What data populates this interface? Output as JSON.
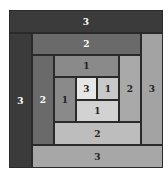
{
  "diagram": {
    "blocks": [
      {
        "id": "outer-top-3",
        "label": "3",
        "x": 9,
        "y": 10,
        "w": 154,
        "h": 23,
        "color": "#3b3b3b",
        "text": "#ffffff"
      },
      {
        "id": "outer-left-3",
        "label": "3",
        "x": 9,
        "y": 33,
        "w": 23,
        "h": 135,
        "color": "#3b3b3b",
        "text": "#ffffff"
      },
      {
        "id": "top-2",
        "label": "2",
        "x": 32,
        "y": 33,
        "w": 109,
        "h": 22,
        "color": "#6a6a6a",
        "text": "#ffffff"
      },
      {
        "id": "right-3",
        "label": "3",
        "x": 141,
        "y": 33,
        "w": 22,
        "h": 112,
        "color": "#a3a3a3",
        "text": "#222222"
      },
      {
        "id": "left-2",
        "label": "2",
        "x": 32,
        "y": 55,
        "w": 22,
        "h": 90,
        "color": "#6a6a6a",
        "text": "#ffffff"
      },
      {
        "id": "top-1",
        "label": "1",
        "x": 54,
        "y": 55,
        "w": 65,
        "h": 22,
        "color": "#8a8a8a",
        "text": "#222222"
      },
      {
        "id": "right-2",
        "label": "2",
        "x": 119,
        "y": 55,
        "w": 22,
        "h": 67,
        "color": "#a9a9a9",
        "text": "#222222"
      },
      {
        "id": "left-1",
        "label": "1",
        "x": 54,
        "y": 77,
        "w": 22,
        "h": 45,
        "color": "#8a8a8a",
        "text": "#222222"
      },
      {
        "id": "center-3",
        "label": "3",
        "x": 76,
        "y": 77,
        "w": 21,
        "h": 23,
        "color": "#e6e6e6",
        "text": "#222222"
      },
      {
        "id": "center-right-1",
        "label": "1",
        "x": 97,
        "y": 77,
        "w": 22,
        "h": 23,
        "color": "#c8c8c8",
        "text": "#222222"
      },
      {
        "id": "center-bottom-1",
        "label": "1",
        "x": 76,
        "y": 100,
        "w": 43,
        "h": 22,
        "color": "#d2d2d2",
        "text": "#222222"
      },
      {
        "id": "bottom-2",
        "label": "2",
        "x": 54,
        "y": 122,
        "w": 87,
        "h": 23,
        "color": "#bdbdbd",
        "text": "#222222"
      },
      {
        "id": "bottom-3",
        "label": "3",
        "x": 32,
        "y": 145,
        "w": 131,
        "h": 23,
        "color": "#a7a7a7",
        "text": "#222222"
      }
    ]
  }
}
